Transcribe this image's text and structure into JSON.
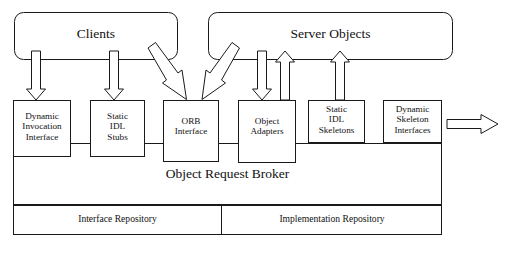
{
  "diagram": {
    "style": {
      "stroke": "#1a1a1a",
      "fill": "#ffffff",
      "text": "#111111",
      "background": "#ffffff"
    },
    "top_boxes": [
      {
        "id": "clients",
        "label": "Clients",
        "x": 14,
        "y": 12,
        "w": 164,
        "h": 48,
        "rounded": 9
      },
      {
        "id": "server-objects",
        "label": "Server Objects",
        "x": 208,
        "y": 12,
        "w": 245,
        "h": 48,
        "rounded": 9
      }
    ],
    "component_boxes": [
      {
        "id": "dynamic-invocation-interface",
        "label": "Dynamic\nInvocation\nInterface",
        "x": 13,
        "y": 100,
        "w": 58,
        "h": 57
      },
      {
        "id": "static-idl-stubs",
        "label": "Static\nIDL\nStubs",
        "x": 90,
        "y": 100,
        "w": 55,
        "h": 57
      },
      {
        "id": "orb-interface",
        "label": "ORB\nInterface",
        "x": 163,
        "y": 100,
        "w": 56,
        "h": 62
      },
      {
        "id": "object-adapters",
        "label": "Object\nAdapters",
        "x": 238,
        "y": 100,
        "w": 58,
        "h": 63
      },
      {
        "id": "static-idl-skeletons",
        "label": "Static\nIDL\nSkeletons",
        "x": 308,
        "y": 100,
        "w": 57,
        "h": 43
      },
      {
        "id": "dynamic-skeleton-interfaces",
        "label": "Dynamic\nSkeleton\nInterfaces",
        "x": 383,
        "y": 100,
        "w": 59,
        "h": 43
      }
    ],
    "orb_band": {
      "id": "object-request-broker",
      "label": "Object Request Broker",
      "x": 13,
      "y": 143,
      "w": 429,
      "h": 62
    },
    "repositories": [
      {
        "id": "interface-repository",
        "label": "Interface Repository",
        "x": 13,
        "y": 205,
        "w": 209,
        "h": 30
      },
      {
        "id": "implementation-repository",
        "label": "Implementation Repository",
        "x": 222,
        "y": 205,
        "w": 220,
        "h": 30
      }
    ],
    "arrows": [
      {
        "id": "clients-to-dii",
        "direction": "down",
        "from": "clients",
        "to": "dynamic-invocation-interface",
        "x": 36,
        "y_top": 51,
        "y_tip": 100,
        "shaft_w": 9,
        "head_w": 19
      },
      {
        "id": "clients-to-stubs",
        "direction": "down",
        "from": "clients",
        "to": "static-idl-stubs",
        "x": 114,
        "y_top": 51,
        "y_tip": 100,
        "shaft_w": 9,
        "head_w": 19
      },
      {
        "id": "clients-to-orb-interface",
        "direction": "diagonal-down-right",
        "from": "clients",
        "to": "orb-interface",
        "x1": 152,
        "y1": 51,
        "x2": 186,
        "y2": 99,
        "shaft_w": 10,
        "head_w": 20
      },
      {
        "id": "server-objects-to-orb-interface",
        "direction": "diagonal-down-left",
        "from": "server-objects",
        "to": "orb-interface",
        "x1": 235,
        "y1": 51,
        "x2": 207,
        "y2": 99,
        "shaft_w": 10,
        "head_w": 20
      },
      {
        "id": "server-objects-to-object-adapters",
        "direction": "down",
        "from": "server-objects",
        "to": "object-adapters",
        "x": 262,
        "y_top": 51,
        "y_tip": 100,
        "shaft_w": 9,
        "head_w": 19
      },
      {
        "id": "object-adapters-to-server-objects",
        "direction": "up",
        "from": "object-adapters",
        "to": "server-objects",
        "x": 285,
        "y_top": 51,
        "y_tip": 100,
        "shaft_w": 9,
        "head_w": 19
      },
      {
        "id": "skeletons-to-server-objects",
        "direction": "up",
        "from": "static-idl-skeletons",
        "to": "server-objects",
        "x": 340,
        "y_top": 51,
        "y_tip": 100,
        "shaft_w": 9,
        "head_w": 19
      },
      {
        "id": "dsi-outbound",
        "direction": "right",
        "from": "dynamic-skeleton-interfaces",
        "to": "external",
        "x_start": 447,
        "x_tip": 498,
        "y": 124,
        "shaft_h": 9,
        "head_h": 20
      }
    ]
  }
}
